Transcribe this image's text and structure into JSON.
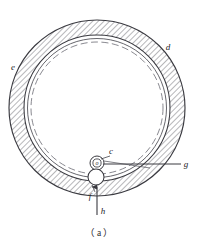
{
  "figure": {
    "caption": "（ a ）",
    "caption_plain": "(a)",
    "type": "engineering-line-drawing",
    "background_color": "#ffffff",
    "line_color": "#3a3a40",
    "hatch_color": "#55555c",
    "dash_color": "#6a6a72"
  },
  "labels": [
    {
      "id": "e",
      "text": "e",
      "x": 13,
      "y": 70,
      "role": "outer-ring-left-callout"
    },
    {
      "id": "d",
      "text": "d",
      "x": 168,
      "y": 50,
      "role": "outer-ring-right-callout"
    },
    {
      "id": "c",
      "text": "c",
      "x": 111,
      "y": 154,
      "role": "inner-band-callout"
    },
    {
      "id": "o",
      "text": "o",
      "x": 96,
      "y": 163,
      "role": "roller-center-mark"
    },
    {
      "id": "g",
      "text": "g",
      "x": 186,
      "y": 167,
      "role": "leader-right-callout"
    },
    {
      "id": "f",
      "text": "f",
      "x": 93,
      "y": 196,
      "role": "lower-roller-callout"
    },
    {
      "id": "h",
      "text": "h",
      "x": 103,
      "y": 212,
      "role": "arrow-callout"
    }
  ],
  "geometry": {
    "ring_center": {
      "x": 97,
      "y": 108
    },
    "outer_radius": 88,
    "ring_inner_radius": 73,
    "gap_inner_radius": 70,
    "dashed_circle_radius": 66,
    "upper_roller": {
      "cx": 97,
      "cy": 163,
      "r_outer": 7,
      "r_inner": 4
    },
    "lower_roller": {
      "cx": 96,
      "cy": 177,
      "r": 8
    },
    "leader_g": {
      "x1": 104,
      "y1": 164,
      "x2": 181,
      "y2": 164
    },
    "arrow_h": {
      "x": 97,
      "y_tail": 215,
      "y_head": 186
    }
  }
}
